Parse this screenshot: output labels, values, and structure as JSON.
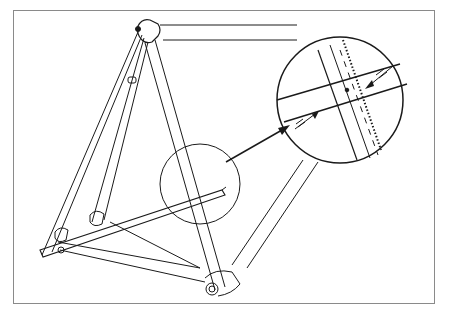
{
  "figure": {
    "detail_inset": "magnified circle showing straightedge crossing seat tube",
    "colors": {
      "line": "#1a1a1a",
      "frame_border": "#8a8a8a",
      "background": "#ffffff"
    }
  },
  "caption": {
    "text": ""
  }
}
